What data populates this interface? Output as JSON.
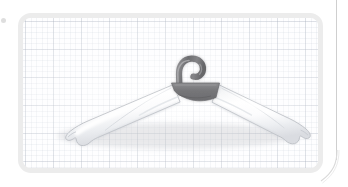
{
  "scene": {
    "title": "Padded clothes hanger on grid backdrop",
    "subject_name": "white-padded-clothes-hanger",
    "background_style": "graph-paper-grid",
    "frame_shape": "rounded-rectangle"
  },
  "frame": {
    "border_color": "#ececec",
    "fill_color": "#fdfdfd",
    "corner_radius": "13px",
    "border_width": "5px",
    "x": 18,
    "y": 13,
    "width": 305,
    "height": 160
  },
  "grid": {
    "minor_spacing_px": 5.6,
    "major_spacing_px": 28,
    "minor_color": "#bac2ce",
    "major_color": "#aab2be",
    "paper_color": "#fefeff"
  },
  "hanger": {
    "name": "padded-clothes-hanger",
    "hook": {
      "name": "hanger-hook",
      "shape": "question-mark-hook",
      "color_dark": "#6f6f71",
      "color_light": "#a8a8aa",
      "tip_x": 162,
      "top_y": 42
    },
    "clamp": {
      "name": "hanger-center-clamp",
      "shape": "trapezoid",
      "color": "#7c7c7e",
      "center_x": 174,
      "center_y": 82
    },
    "left_arm": {
      "name": "hanger-left-arm",
      "fill": "#fdfdfd",
      "shade": "#d8dade",
      "outline": "#b9bcc2",
      "tip_x": 62,
      "tip_y": 126,
      "angle_deg": -28
    },
    "right_arm": {
      "name": "hanger-right-arm",
      "fill": "#fdfdfd",
      "shade": "#d8dade",
      "outline": "#b9bcc2",
      "tip_x": 284,
      "tip_y": 126,
      "angle_deg": 28
    }
  },
  "page_artifacts": {
    "vertical_rule_color": "#cfcfcf",
    "vertical_rule_x": 336,
    "corner_curve_color": "#d9d9d9",
    "speck_color": "#d8d8d8"
  }
}
